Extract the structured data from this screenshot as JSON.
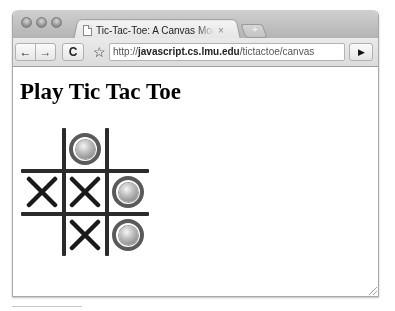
{
  "browser": {
    "tab": {
      "title": "Tic-Tac-Toe: A Canvas Model",
      "close_glyph": "×",
      "icon": "document-icon"
    },
    "new_tab_glyph": "+",
    "toolbar": {
      "back_glyph": "←",
      "forward_glyph": "→",
      "reload_glyph": "C",
      "bookmark_glyph": "☆",
      "go_glyph": "▶"
    },
    "address": {
      "scheme": "http://",
      "host": "javascript.cs.lmu.edu",
      "path": "/tictactoe/canvas"
    },
    "window_controls": [
      "close",
      "minimize",
      "zoom"
    ]
  },
  "page": {
    "heading": "Play Tic Tac Toe",
    "board": {
      "rows": [
        [
          "",
          "O",
          ""
        ],
        [
          "X",
          "X",
          "O"
        ],
        [
          "",
          "X",
          "O"
        ]
      ],
      "x_glyph": "✕",
      "line_color": "#2b2b2b",
      "mark_color": "#1a1a1a"
    }
  }
}
